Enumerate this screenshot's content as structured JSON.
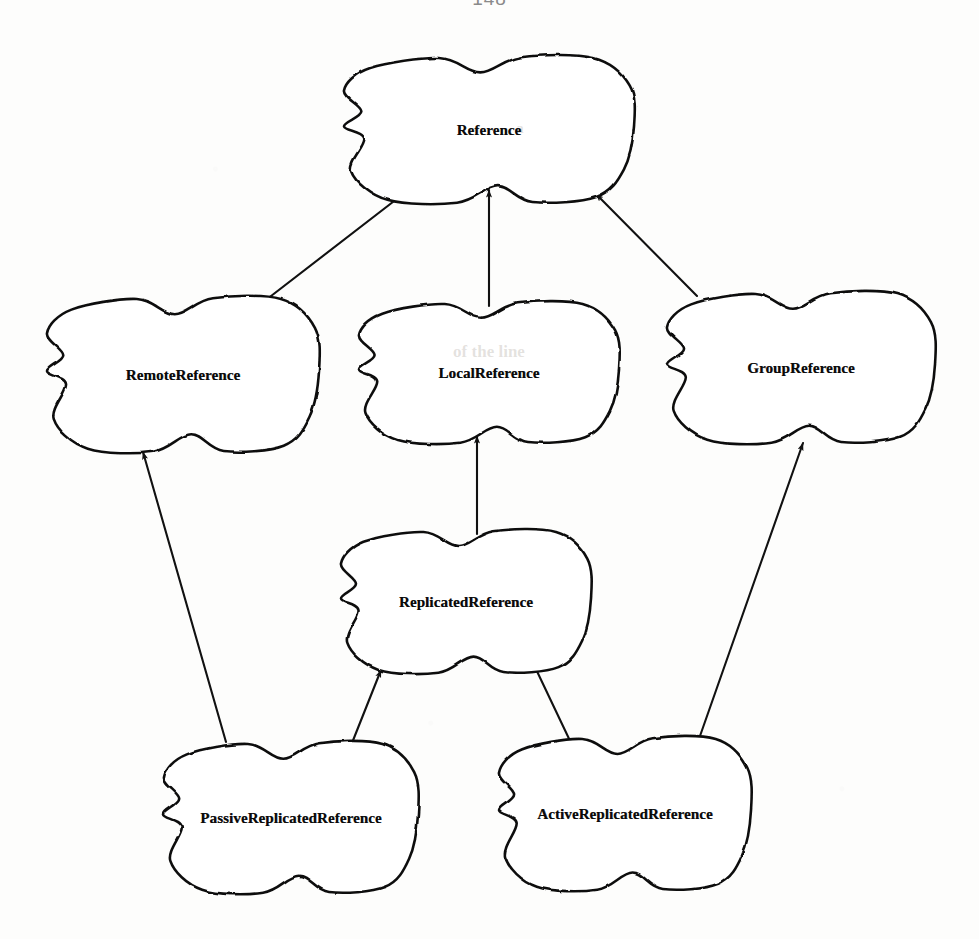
{
  "page": {
    "page_number": "148",
    "width": 979,
    "height": 939,
    "background_color": "#fdfdfc",
    "ink_color": "#111111"
  },
  "diagram": {
    "type": "class-inheritance-hierarchy",
    "node_shape": "hand-drawn-cloud-blob",
    "arrow_style": "open-line-with-solid-triangle-head",
    "arrow_meaning": "inherits-from",
    "nodes": [
      {
        "id": "reference",
        "label": "Reference",
        "cx": 489,
        "cy": 130,
        "rx": 145,
        "ry": 72,
        "font_size": 15
      },
      {
        "id": "remote-reference",
        "label": "RemoteReference",
        "cx": 183,
        "cy": 375,
        "rx": 136,
        "ry": 76,
        "font_size": 15
      },
      {
        "id": "local-reference",
        "label": "LocalReference",
        "cx": 489,
        "cy": 373,
        "rx": 130,
        "ry": 69,
        "font_size": 15
      },
      {
        "id": "group-reference",
        "label": "GroupReference",
        "cx": 801,
        "cy": 368,
        "rx": 134,
        "ry": 74,
        "font_size": 15
      },
      {
        "id": "replicated-reference",
        "label": "ReplicatedReference",
        "cx": 466,
        "cy": 602,
        "rx": 125,
        "ry": 70,
        "font_size": 15
      },
      {
        "id": "passive-replicated-reference",
        "label": "PassiveReplicatedReference",
        "cx": 291,
        "cy": 818,
        "rx": 127,
        "ry": 74,
        "font_size": 15
      },
      {
        "id": "active-replicated-reference",
        "label": "ActiveReplicatedReference",
        "cx": 625,
        "cy": 814,
        "rx": 126,
        "ry": 75,
        "font_size": 15
      }
    ],
    "edges": [
      {
        "id": "remote-to-reference",
        "from": "remote-reference",
        "to": "reference",
        "x1": 262,
        "y1": 303,
        "x2": 411,
        "y2": 188
      },
      {
        "id": "local-to-reference",
        "from": "local-reference",
        "to": "reference",
        "x1": 489,
        "y1": 306,
        "x2": 489,
        "y2": 190
      },
      {
        "id": "group-to-reference",
        "from": "group-reference",
        "to": "reference",
        "x1": 697,
        "y1": 296,
        "x2": 596,
        "y2": 194
      },
      {
        "id": "replicated-to-local",
        "from": "replicated-reference",
        "to": "local-reference",
        "x1": 477,
        "y1": 534,
        "x2": 477,
        "y2": 436
      },
      {
        "id": "passive-to-remote",
        "from": "passive-replicated-reference",
        "to": "remote-reference",
        "x1": 226,
        "y1": 742,
        "x2": 143,
        "y2": 452
      },
      {
        "id": "passive-to-replicated",
        "from": "passive-replicated-reference",
        "to": "replicated-reference",
        "x1": 350,
        "y1": 748,
        "x2": 381,
        "y2": 670
      },
      {
        "id": "active-to-replicated",
        "from": "active-replicated-reference",
        "to": "replicated-reference",
        "x1": 572,
        "y1": 745,
        "x2": 534,
        "y2": 665
      },
      {
        "id": "active-to-group",
        "from": "active-replicated-reference",
        "to": "group-reference",
        "x1": 700,
        "y1": 736,
        "x2": 803,
        "y2": 443
      }
    ],
    "ghost_text": [
      {
        "id": "ghost-local",
        "text": "of the line",
        "x": 489,
        "y": 352,
        "size": 17
      },
      {
        "id": "ghost-top",
        "text": "a",
        "x": 520,
        "y": 128,
        "size": 15
      }
    ]
  }
}
